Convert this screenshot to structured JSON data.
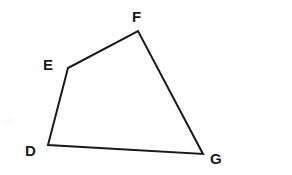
{
  "figure": {
    "kind": "quadrilateral-diagram",
    "background_color": "#ffffff",
    "stroke_color": "#1a1a1a",
    "stroke_width": 2,
    "label_color": "#1a1a1a",
    "canvas": {
      "width": 292,
      "height": 175
    },
    "vertices": [
      {
        "id": "D",
        "label": "D",
        "x": 48,
        "y": 145,
        "label_x": 25,
        "label_y": 143
      },
      {
        "id": "E",
        "label": "E",
        "x": 68,
        "y": 68,
        "label_x": 43,
        "label_y": 57
      },
      {
        "id": "F",
        "label": "F",
        "x": 138,
        "y": 31,
        "label_x": 132,
        "label_y": 9
      },
      {
        "id": "G",
        "label": "G",
        "x": 203,
        "y": 154,
        "label_x": 210,
        "label_y": 151
      }
    ],
    "edges": [
      {
        "id": "DE",
        "from": "D",
        "to": "E"
      },
      {
        "id": "EF",
        "from": "E",
        "to": "F"
      },
      {
        "id": "FG",
        "from": "F",
        "to": "G"
      },
      {
        "id": "GD",
        "from": "G",
        "to": "D"
      }
    ],
    "polygon_points": "48,145 68,68 138,31 203,154"
  }
}
